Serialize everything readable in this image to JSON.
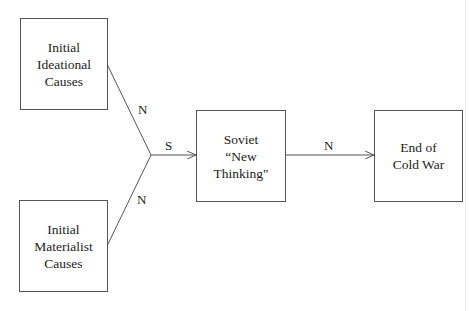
{
  "nodes": {
    "ideational": {
      "lines": [
        "Initial",
        "Ideational",
        "Causes"
      ]
    },
    "materialist": {
      "lines": [
        "Initial",
        "Materialist",
        "Causes"
      ]
    },
    "soviet": {
      "lines": [
        "Soviet",
        "“New",
        "Thinking\""
      ]
    },
    "end": {
      "lines": [
        "End of",
        "Cold War"
      ]
    }
  },
  "edges": {
    "ideational_to_junction": {
      "label": "N"
    },
    "materialist_to_junction": {
      "label": "N"
    },
    "junction_to_soviet": {
      "label": "S"
    },
    "soviet_to_end": {
      "label": "N"
    }
  },
  "colors": {
    "line": "#555555",
    "text": "#222222"
  }
}
